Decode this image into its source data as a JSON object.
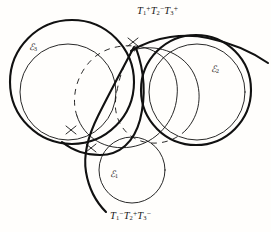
{
  "figure": {
    "background_color": "#fffefc",
    "ink_color": "#111111",
    "labels": {
      "tangent_top": {
        "text": "T1+T2-T3+",
        "parts": [
          {
            "base": "T",
            "sub": "1",
            "sup": "+"
          },
          {
            "base": "T",
            "sub": "2",
            "sup": "−"
          },
          {
            "base": "T",
            "sub": "3",
            "sup": "+"
          }
        ]
      },
      "tangent_bottom": {
        "text": "T1-T2+T3-",
        "parts": [
          {
            "base": "T",
            "sub": "1",
            "sup": "−"
          },
          {
            "base": "T",
            "sub": "2",
            "sup": "+"
          },
          {
            "base": "T",
            "sub": "3",
            "sup": "−"
          }
        ]
      },
      "circle_1": {
        "symbol": "ℰ",
        "sub": "1"
      },
      "circle_2": {
        "symbol": "ℰ",
        "sub": "2"
      },
      "circle_3": {
        "symbol": "ℰ",
        "sub": "3"
      }
    },
    "geometry": {
      "base_circles": [
        {
          "name": "C3",
          "cx": 68,
          "cy": 92,
          "r": 48,
          "stroke": 0.9,
          "style": "solid"
        },
        {
          "name": "C2",
          "cx": 197,
          "cy": 92,
          "r": 48,
          "stroke": 0.9,
          "style": "solid"
        },
        {
          "name": "C1",
          "cx": 132,
          "cy": 170,
          "r": 33,
          "stroke": 0.9,
          "style": "solid"
        }
      ],
      "solution_circles": [
        {
          "name": "outer-left",
          "cx": 72,
          "cy": 82,
          "r": 62,
          "stroke": 2.0
        },
        {
          "name": "outer-right",
          "cx": 196,
          "cy": 90,
          "r": 55,
          "stroke": 2.0
        }
      ],
      "hidden_arc_style": "dashed",
      "tick_marks": 3
    }
  }
}
